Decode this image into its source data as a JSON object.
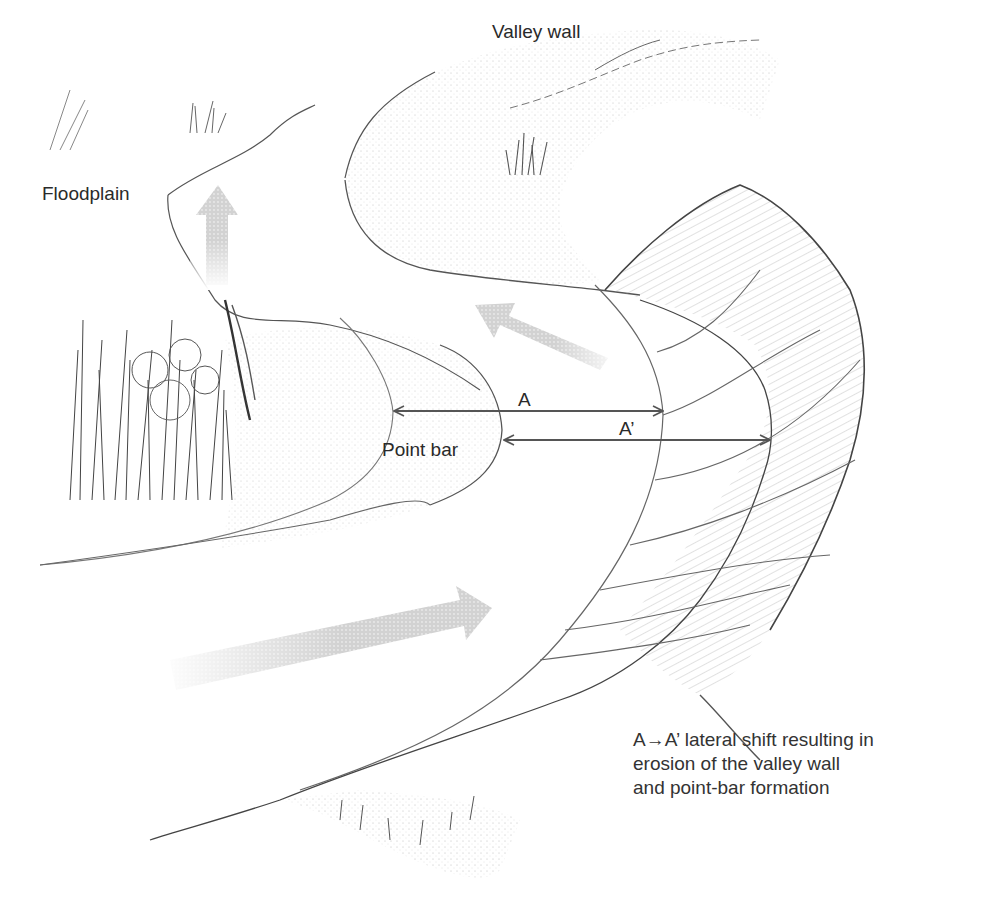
{
  "figure": {
    "labels": {
      "valley_wall": "Valley wall",
      "floodplain": "Floodplain",
      "point_bar": "Point bar",
      "a": "A",
      "a_prime": "A’"
    },
    "caption_lines": [
      "A→A’ lateral shift resulting in",
      "erosion of the valley wall",
      "and point-bar formation"
    ],
    "measurements": [
      {
        "name": "A",
        "from": "point-bar edge (old)",
        "to": "old outer bank",
        "x1": 392,
        "x2": 663,
        "y": 411
      },
      {
        "name": "A’",
        "from": "point-bar edge (new)",
        "to": "eroded valley wall",
        "x1": 502,
        "x2": 770,
        "y": 440
      }
    ],
    "flow_arrows": [
      {
        "name": "upper-flow-arrow",
        "direction": "up"
      },
      {
        "name": "middle-flow-arrow",
        "direction": "up-left"
      },
      {
        "name": "lower-flow-arrow",
        "direction": "right"
      }
    ],
    "colors": {
      "ink": "#3a3a3a",
      "line": "#6b6b6b",
      "arrow_fill": "#c8c8c8",
      "text": "#2a2a2a",
      "background": "#ffffff"
    }
  }
}
